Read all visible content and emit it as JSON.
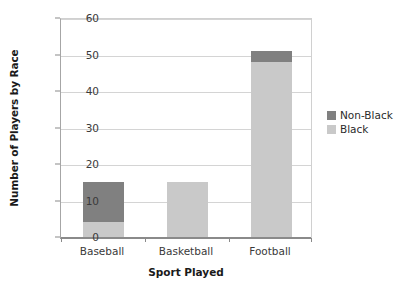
{
  "chart_data": {
    "type": "bar",
    "stacked": true,
    "title": "",
    "xlabel": "Sport Played",
    "ylabel": "Number of Players by Race",
    "categories": [
      "Baseball",
      "Basketball",
      "Football"
    ],
    "series": [
      {
        "name": "Black",
        "color": "#c9c9c9",
        "values": [
          4,
          15,
          48
        ]
      },
      {
        "name": "Non-Black",
        "color": "#808080",
        "values": [
          11,
          0,
          3
        ]
      }
    ],
    "totals": [
      15,
      15,
      51
    ],
    "ylim": [
      0,
      60
    ],
    "ytick_step": 10,
    "yticks": [
      "60",
      "50",
      "40",
      "30",
      "20",
      "10",
      "0"
    ],
    "ytick_values": [
      60,
      50,
      40,
      30,
      20,
      10,
      0
    ],
    "grid": true,
    "grid_axis": "y",
    "legend_position": "right",
    "legend_order": [
      "Non-Black",
      "Black"
    ]
  },
  "axes": {
    "y_title": "Number of Players by Race",
    "x_title": "Sport Played"
  },
  "legend": {
    "entries": [
      {
        "label": "Non-Black",
        "color": "#808080"
      },
      {
        "label": "Black",
        "color": "#c9c9c9"
      }
    ]
  },
  "colors": {
    "non_black": "#808080",
    "black": "#c9c9c9",
    "gridline": "#d4d4d4",
    "axis": "#8a8a8a",
    "text": "#2b2b2b",
    "background": "#ffffff"
  }
}
